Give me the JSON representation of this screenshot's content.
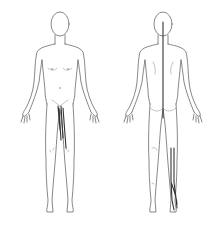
{
  "diagram": {
    "type": "body-chart",
    "views": [
      {
        "id": "front",
        "label": "Anterior view"
      },
      {
        "id": "back",
        "label": "Posterior view"
      }
    ],
    "colors": {
      "background": "#ffffff",
      "outline": "#555555",
      "marking": "#333333"
    },
    "markings": [
      {
        "view": "front",
        "region": "groin-to-thigh",
        "shape": "lines"
      },
      {
        "view": "back",
        "region": "spine",
        "shape": "vertical-line"
      },
      {
        "view": "back",
        "region": "right-calf-to-heel",
        "shape": "lines"
      }
    ]
  }
}
